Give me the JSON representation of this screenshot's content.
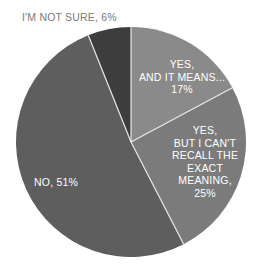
{
  "chart_data": {
    "type": "pie",
    "title": "",
    "start_angle": "12 o'clock",
    "direction": "clockwise",
    "slices": [
      {
        "label": "YES, AND IT MEANS...",
        "value": 17,
        "color": "#8a8a8a"
      },
      {
        "label": "YES, BUT I CAN'T RECALL THE EXACT MEANING",
        "value": 25,
        "color": "#7b7b7b"
      },
      {
        "label": "NO",
        "value": 51,
        "color": "#5e5e5e"
      },
      {
        "label": "I'M NOT SURE",
        "value": 6,
        "color": "#3d3d3d"
      }
    ],
    "unit": "%",
    "separator_color": "#e8e8e8"
  },
  "labels": {
    "yes_means": {
      "line1": "YES,",
      "line2": "AND IT MEANS...",
      "line3": "17%"
    },
    "yes_recall": {
      "line1": "YES,",
      "line2": "BUT I CAN'T",
      "line3": "RECALL THE",
      "line4": "EXACT",
      "line5": "MEANING,",
      "line6": "25%"
    },
    "no": {
      "text": "NO, 51%"
    },
    "not_sure": {
      "text": "I'M NOT SURE, 6%"
    }
  }
}
